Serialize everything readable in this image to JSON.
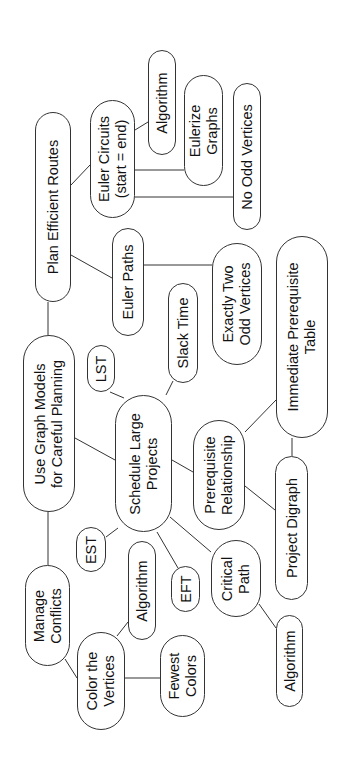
{
  "diagram": {
    "type": "concept-map",
    "orientation": "rotated-90-ccw",
    "colors": {
      "stroke": "#333333",
      "text": "#111111",
      "background": "#ffffff"
    },
    "nodes": [
      {
        "id": "plan",
        "label": "Plan Efficient Routes",
        "x": 35,
        "y": 112,
        "w": 36,
        "h": 190
      },
      {
        "id": "circuits",
        "label": "Euler Circuits\n(start = end)",
        "x": 90,
        "y": 100,
        "w": 45,
        "h": 118
      },
      {
        "id": "alg_top",
        "label": "Algorithm",
        "x": 148,
        "y": 50,
        "w": 28,
        "h": 105
      },
      {
        "id": "eulerize",
        "label": "Eulerize\nGraphs",
        "x": 184,
        "y": 75,
        "w": 39,
        "h": 111
      },
      {
        "id": "noodd",
        "label": "No Odd Vertices",
        "x": 233,
        "y": 83,
        "w": 28,
        "h": 147
      },
      {
        "id": "paths",
        "label": "Euler Paths",
        "x": 112,
        "y": 228,
        "w": 32,
        "h": 108
      },
      {
        "id": "twoodd",
        "label": "Exactly Two\nOdd Vertices",
        "x": 212,
        "y": 243,
        "w": 50,
        "h": 122
      },
      {
        "id": "slack",
        "label": "Slack Time",
        "x": 168,
        "y": 283,
        "w": 30,
        "h": 100
      },
      {
        "id": "lst",
        "label": "LST",
        "x": 87,
        "y": 345,
        "w": 28,
        "h": 47
      },
      {
        "id": "root",
        "label": "Use Graph Models\nfor Careful Planning",
        "x": 23,
        "y": 335,
        "w": 52,
        "h": 177
      },
      {
        "id": "schedule",
        "label": "Schedule Large\nProjects",
        "x": 115,
        "y": 395,
        "w": 57,
        "h": 137
      },
      {
        "id": "prereq",
        "label": "Prerequisite\nRelationship",
        "x": 193,
        "y": 420,
        "w": 52,
        "h": 110
      },
      {
        "id": "table",
        "label": "Immediate Prerequisite\nTable",
        "x": 276,
        "y": 236,
        "w": 52,
        "h": 202
      },
      {
        "id": "digraph",
        "label": "Project Digraph",
        "x": 275,
        "y": 456,
        "w": 33,
        "h": 144
      },
      {
        "id": "est",
        "label": "EST",
        "x": 76,
        "y": 527,
        "w": 30,
        "h": 45
      },
      {
        "id": "alg_mid",
        "label": "Algorithm",
        "x": 128,
        "y": 541,
        "w": 28,
        "h": 99
      },
      {
        "id": "eft",
        "label": "EFT",
        "x": 171,
        "y": 566,
        "w": 29,
        "h": 46
      },
      {
        "id": "critical",
        "label": "Critical\nPath",
        "x": 211,
        "y": 540,
        "w": 50,
        "h": 77
      },
      {
        "id": "manage",
        "label": "Manage\nConflicts",
        "x": 25,
        "y": 565,
        "w": 45,
        "h": 101
      },
      {
        "id": "color",
        "label": "Color the\nVertices",
        "x": 77,
        "y": 632,
        "w": 48,
        "h": 98
      },
      {
        "id": "fewest",
        "label": "Fewest\nColors",
        "x": 160,
        "y": 635,
        "w": 45,
        "h": 82
      },
      {
        "id": "alg_bot",
        "label": "Algorithm",
        "x": 276,
        "y": 615,
        "w": 27,
        "h": 92
      }
    ],
    "edges": [
      {
        "x1": 48,
        "y1": 302,
        "x2": 48,
        "y2": 335
      },
      {
        "x1": 48,
        "y1": 512,
        "x2": 48,
        "y2": 565
      },
      {
        "x1": 71,
        "y1": 185,
        "x2": 90,
        "y2": 165
      },
      {
        "x1": 71,
        "y1": 255,
        "x2": 112,
        "y2": 278
      },
      {
        "x1": 135,
        "y1": 130,
        "x2": 148,
        "y2": 122
      },
      {
        "x1": 135,
        "y1": 170,
        "x2": 184,
        "y2": 170
      },
      {
        "x1": 135,
        "y1": 197,
        "x2": 233,
        "y2": 197
      },
      {
        "x1": 144,
        "y1": 265,
        "x2": 212,
        "y2": 265
      },
      {
        "x1": 75,
        "y1": 438,
        "x2": 115,
        "y2": 460
      },
      {
        "x1": 110,
        "y1": 392,
        "x2": 124,
        "y2": 398
      },
      {
        "x1": 166,
        "y1": 395,
        "x2": 173,
        "y2": 381
      },
      {
        "x1": 172,
        "y1": 460,
        "x2": 193,
        "y2": 472
      },
      {
        "x1": 245,
        "y1": 432,
        "x2": 276,
        "y2": 400
      },
      {
        "x1": 245,
        "y1": 486,
        "x2": 275,
        "y2": 510
      },
      {
        "x1": 292,
        "y1": 438,
        "x2": 292,
        "y2": 456
      },
      {
        "x1": 106,
        "y1": 537,
        "x2": 118,
        "y2": 528
      },
      {
        "x1": 157,
        "y1": 532,
        "x2": 178,
        "y2": 568
      },
      {
        "x1": 170,
        "y1": 517,
        "x2": 211,
        "y2": 552
      },
      {
        "x1": 259,
        "y1": 604,
        "x2": 276,
        "y2": 628
      },
      {
        "x1": 65,
        "y1": 659,
        "x2": 77,
        "y2": 678
      },
      {
        "x1": 117,
        "y1": 636,
        "x2": 128,
        "y2": 622
      },
      {
        "x1": 125,
        "y1": 678,
        "x2": 160,
        "y2": 678
      }
    ]
  }
}
